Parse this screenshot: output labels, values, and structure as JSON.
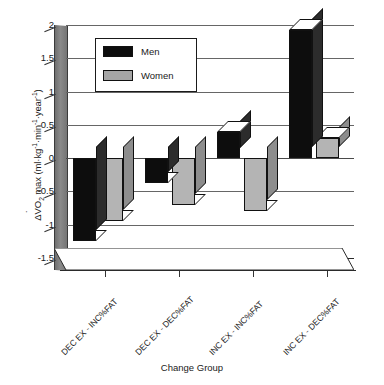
{
  "chart_data": {
    "type": "bar",
    "title": "",
    "subtitle": "",
    "xlabel": "Change Group",
    "ylabel": "ΔV̇O2 max (ml·kg⁻¹·min⁻¹·year⁻¹)",
    "ylabel_parts": {
      "delta": "Δ",
      "v_dot": "V",
      "o": "O",
      "sub2": "2",
      "max": " max (ml·kg",
      "exp1": "-1",
      "mid1": "·min",
      "exp2": "-1",
      "mid2": "·year",
      "exp3": "-1",
      "close": ")"
    },
    "categories": [
      "DEC EX - INC%FAT",
      "DEC EX - DEC%FAT",
      "INC EX - INC%FAT",
      "INC EX - DEC%FAT"
    ],
    "series": [
      {
        "name": "Men",
        "color": "#0d0d0d",
        "values": [
          -1.25,
          -0.38,
          0.4,
          1.92
        ]
      },
      {
        "name": "Women",
        "color": "#b4b4b4",
        "values": [
          -0.95,
          -0.7,
          -0.8,
          0.3
        ]
      }
    ],
    "ylim": [
      -1.5,
      2
    ],
    "ytick_labels": [
      "2",
      "1.5",
      "1",
      "0.5",
      "0",
      "-0.5",
      "-1",
      "-1.5"
    ],
    "ytick_values": [
      2,
      1.5,
      1,
      0.5,
      0,
      -0.5,
      -1,
      -1.5
    ],
    "ytick_interval": 0.5,
    "grid": true,
    "grid_axis": "y",
    "legend_position": "upper-left-inside",
    "style": "3d-bar",
    "legend": [
      {
        "label": "Men",
        "swatch": "black"
      },
      {
        "label": "Women",
        "swatch": "gray"
      }
    ]
  },
  "colors": {
    "men": "#0d0d0d",
    "women": "#b4b4b4",
    "men_side": "#2c2c2c",
    "women_side": "#8d8d8d",
    "grid": "#666666",
    "axis": "#2a2a2a",
    "wall": "#8a8a8a",
    "background": "#ffffff"
  }
}
